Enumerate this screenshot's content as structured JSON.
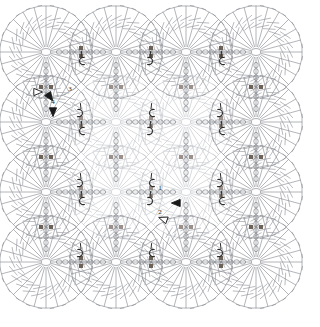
{
  "diagram": {
    "type": "crochet-stitch-chart",
    "canvas": {
      "width": 320,
      "height": 327,
      "background": "#ffffff"
    },
    "colors": {
      "motif_outer": "#8a8d93",
      "motif_inner": "#c3c6cb",
      "chain": "#7e8186",
      "marker_dot": "#6d6257",
      "marker_dot_light": "#9a9089",
      "arrow_fill": "#1a1a1a",
      "arrow_outline": "#1a1a1a",
      "label": "#222222"
    },
    "grid": {
      "rows": 4,
      "cols": 4,
      "motif_radius": 46,
      "spoke_count": 24,
      "centers_x": [
        46,
        116,
        186,
        256
      ],
      "centers_y": [
        52,
        122,
        192,
        262
      ]
    },
    "labels": [
      {
        "id": "label-3",
        "text": "3",
        "x": 70,
        "y": 91
      },
      {
        "id": "label-4",
        "text": "4",
        "x": 53,
        "y": 104
      },
      {
        "id": "label-1",
        "text": "1",
        "x": 160,
        "y": 190
      },
      {
        "id": "label-2",
        "text": "2",
        "x": 160,
        "y": 214
      }
    ],
    "markers": {
      "start_arrow_outline_count": 2,
      "filled_arrow_count": 3,
      "join_hook_count": 10,
      "chain_dot_count": 26
    },
    "legend_note": ""
  }
}
